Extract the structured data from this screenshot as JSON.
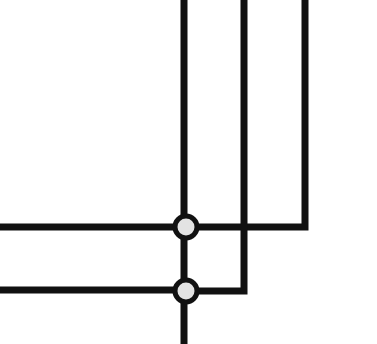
{
  "diagram": {
    "type": "orthogonal-wire-routing-diagram",
    "canvas": {
      "width": 377,
      "height": 344,
      "background_color": "#ffffff"
    },
    "style": {
      "wire_color": "#111111",
      "wire_width": 7,
      "junction_fill_color": "#e3e3e3",
      "junction_stroke_color": "#111111",
      "junction_stroke_width": 5,
      "junction_radius": 11
    },
    "junctions": [
      {
        "id": "junction-upper",
        "label": "upper-junction-node",
        "cx": 186,
        "cy": 227,
        "r": 11,
        "fill": "#e3e3e3",
        "stroke": "#111111",
        "stroke_width": 5
      },
      {
        "id": "junction-lower",
        "label": "lower-junction-node",
        "cx": 186,
        "cy": 291,
        "r": 11,
        "fill": "#e3e3e3",
        "stroke": "#111111",
        "stroke_width": 5
      }
    ],
    "wires": [
      {
        "id": "wire-vertical-main",
        "label": "main-vertical-bus",
        "description": "Vertical line at x=184 running from top edge through both junctions to bottom edge",
        "points": [
          [
            184,
            0
          ],
          [
            184,
            344
          ]
        ]
      },
      {
        "id": "wire-vertical-middle",
        "label": "middle-vertical-drop-to-lower-junction",
        "description": "Vertical line at x=244 from top edge down to y=291 then left into lower junction",
        "points": [
          [
            244,
            0
          ],
          [
            244,
            291
          ],
          [
            186,
            291
          ]
        ]
      },
      {
        "id": "wire-vertical-right",
        "label": "right-vertical-drop-to-upper-junction",
        "description": "Vertical line at x=305 from top edge down to y=227 then left into upper junction",
        "points": [
          [
            305,
            0
          ],
          [
            305,
            227
          ],
          [
            186,
            227
          ]
        ]
      },
      {
        "id": "wire-horizontal-upper",
        "label": "upper-horizontal-rail",
        "description": "Horizontal line at y=227 from left edge to upper junction",
        "points": [
          [
            0,
            227
          ],
          [
            186,
            227
          ]
        ]
      },
      {
        "id": "wire-horizontal-lower",
        "label": "lower-horizontal-rail",
        "description": "Horizontal line at y=290 from left edge to lower junction",
        "points": [
          [
            0,
            290
          ],
          [
            186,
            290
          ]
        ]
      }
    ],
    "terminals": [
      {
        "id": "terminal-top-1",
        "label": "top-terminal-left",
        "x": 184,
        "y": 0
      },
      {
        "id": "terminal-top-2",
        "label": "top-terminal-middle",
        "x": 244,
        "y": 0
      },
      {
        "id": "terminal-top-3",
        "label": "top-terminal-right",
        "x": 305,
        "y": 0
      },
      {
        "id": "terminal-left-1",
        "label": "left-terminal-upper",
        "x": 0,
        "y": 227
      },
      {
        "id": "terminal-left-2",
        "label": "left-terminal-lower",
        "x": 0,
        "y": 290
      },
      {
        "id": "terminal-bottom-1",
        "label": "bottom-terminal",
        "x": 184,
        "y": 344
      }
    ]
  }
}
